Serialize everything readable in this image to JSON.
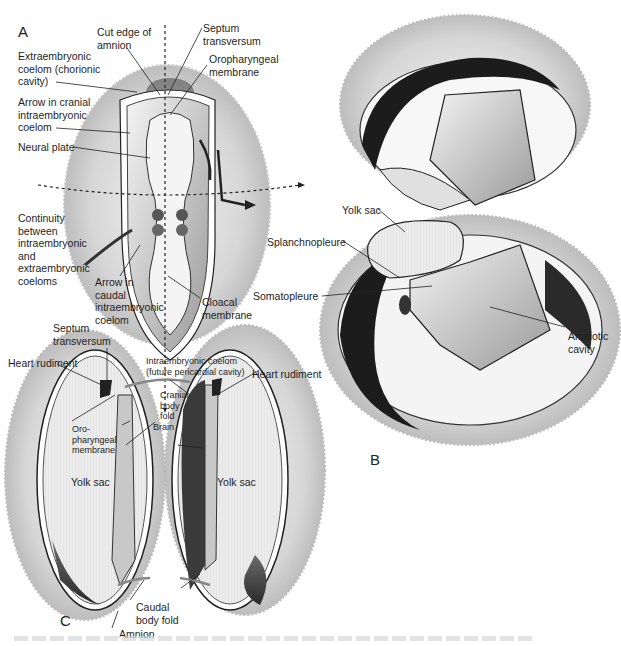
{
  "figure": {
    "panels": [
      {
        "id": "A",
        "label": "A"
      },
      {
        "id": "B",
        "label": "B"
      },
      {
        "id": "C",
        "label": "C"
      }
    ],
    "panel_A": {
      "labels": {
        "cut_edge_amnion": "Cut edge of\namnion",
        "septum_transversum": "Septum\ntransversum",
        "extraembryonic_coelom": "Extraembryonic\ncoelom (chorionic\ncavity)",
        "oropharyngeal_membrane": "Oropharyngeal\nmembrane",
        "arrow_cranial": "Arrow in cranial\nintraembryonic\ncoelom",
        "neural_plate": "Neural plate",
        "continuity": "Continuity\nbetween\nintraembryonic\nand\nextraembryonic\ncoeloms",
        "arrow_caudal": "Arrow in\ncaudal\nintraembryonic\ncoelom",
        "cloacal_membrane": "Cloacal\nmembrane"
      }
    },
    "panel_B": {
      "labels": {
        "yolk_sac": "Yolk sac",
        "splanchnopleure": "Splanchnopleure",
        "somatopleure": "Somatopleure",
        "amniotic_cavity": "Amniotic\ncavity"
      }
    },
    "panel_C": {
      "labels": {
        "septum_transversum": "Septum\ntransversum",
        "heart_rudiment_left": "Heart rudiment",
        "intraembryonic_coelom": "Intraembryonic coelom\n(future pericardial cavity)",
        "heart_rudiment_right": "Heart rudiment",
        "cranial_body_fold": "Cranial\nbody\nfold",
        "oropharyngeal_membrane": "Oro-\npharyngeal\nmembrane",
        "brain": "Brain",
        "yolk_sac_left": "Yolk sac",
        "yolk_sac_right": "Yolk sac",
        "caudal_body_fold": "Caudal\nbody fold",
        "amnion": "Amnion"
      }
    },
    "colors": {
      "chorion_fuzz": "#c8c8c8",
      "dark_coelom": "#3a3a3a",
      "mid_gray": "#8a8a8a",
      "light_gray": "#e4e4e4",
      "line": "#222222"
    }
  }
}
